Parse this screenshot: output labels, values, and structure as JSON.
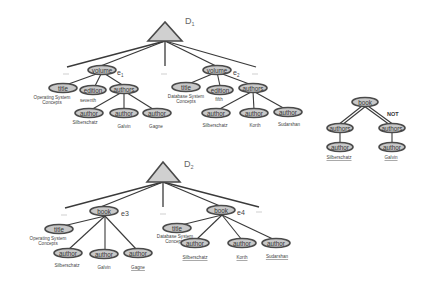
{
  "diagram": {
    "type": "xml-document-trees",
    "documents": [
      {
        "id": "D1",
        "label_main": "D",
        "label_sub": "1",
        "elements": [
          {
            "tag": "volume",
            "marker": "e",
            "marker_sub": "1",
            "children": [
              {
                "tag": "title",
                "value_lines": [
                  "Operating System",
                  "Concepts"
                ]
              },
              {
                "tag": "edition",
                "value_lines": [
                  "seventh"
                ]
              },
              {
                "tag": "authors",
                "children": [
                  {
                    "tag": "author",
                    "value": "Silberschatz"
                  },
                  {
                    "tag": "author",
                    "value": "Galvin"
                  },
                  {
                    "tag": "author",
                    "value": "Gagne"
                  }
                ]
              }
            ]
          },
          {
            "tag": "volume",
            "marker": "e",
            "marker_sub": "2",
            "children": [
              {
                "tag": "title",
                "value_lines": [
                  "Database System",
                  "Concepts"
                ]
              },
              {
                "tag": "edition",
                "value_lines": [
                  "fifth"
                ]
              },
              {
                "tag": "authors",
                "children": [
                  {
                    "tag": "author",
                    "value": "Silberschatz"
                  },
                  {
                    "tag": "author",
                    "value": "Korth"
                  },
                  {
                    "tag": "author",
                    "value": "Sudarshan"
                  }
                ]
              }
            ]
          }
        ],
        "ellipsis_marker": "..."
      },
      {
        "id": "D2",
        "label_main": "D",
        "label_sub": "2",
        "elements": [
          {
            "tag": "book",
            "marker": "e3",
            "children": [
              {
                "tag": "title",
                "value_lines": [
                  "Operating System",
                  "Concepts"
                ]
              },
              {
                "tag": "author",
                "value": "Silberschatz"
              },
              {
                "tag": "author",
                "value": "Galvin"
              },
              {
                "tag": "author",
                "value": "Gagne"
              }
            ]
          },
          {
            "tag": "book",
            "marker": "e4",
            "children": [
              {
                "tag": "title",
                "value_lines": [
                  "Database System",
                  "Concepts"
                ]
              },
              {
                "tag": "author",
                "value": "Silberschatz"
              },
              {
                "tag": "author",
                "value": "Korth"
              },
              {
                "tag": "author",
                "value": "Sudarshan"
              }
            ]
          }
        ],
        "ellipsis_marker": "..."
      }
    ],
    "query": {
      "root": "book",
      "negation_label": "NOT",
      "branches": [
        {
          "tag": "authors",
          "child": "author",
          "value": "Silberschatz",
          "negated": false
        },
        {
          "tag": "authors",
          "child": "author",
          "value": "Galvin",
          "negated": true
        }
      ]
    }
  }
}
